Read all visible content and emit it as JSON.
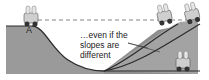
{
  "diagram": {
    "point_label": "A",
    "caption_lines": [
      "…even if the",
      "slopes are",
      "different"
    ],
    "colors": {
      "ground": "#9a9a9a",
      "ground_dark": "#7d7d7d",
      "track": "#2b2b2b",
      "dashed_line": "#666666",
      "background": "#ffffff"
    },
    "icons": [
      "coaster-car-icon"
    ]
  }
}
